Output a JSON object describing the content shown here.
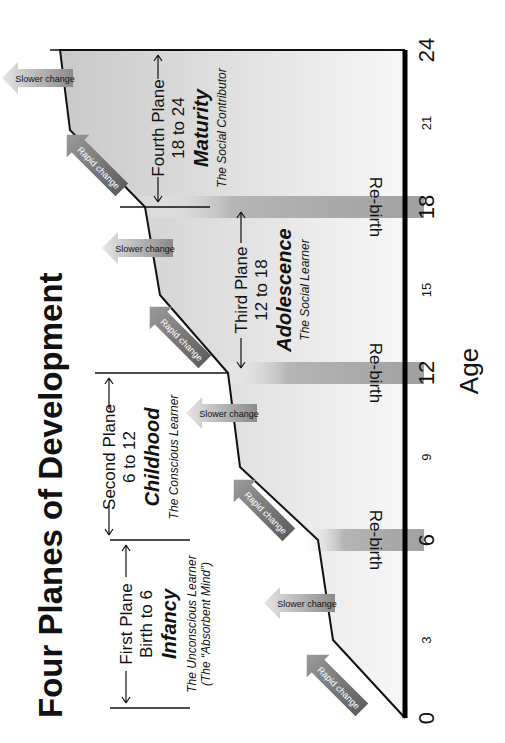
{
  "title": "Four Planes of Development",
  "axis": {
    "label": "Age",
    "ticks_major": [
      "0",
      "6",
      "12",
      "18",
      "24"
    ],
    "ticks_minor": [
      "3",
      "9",
      "15",
      "21"
    ]
  },
  "rebirth_label": "Re-birth",
  "planes": [
    {
      "name": "First Plane",
      "range": "Birth to 6",
      "stage": "Infancy",
      "description": "The Unconscious Learner",
      "description2": "(The “Absorbent Mind”)"
    },
    {
      "name": "Second Plane",
      "range": "6 to 12",
      "stage": "Childhood",
      "description": "The Conscious Learner"
    },
    {
      "name": "Third Plane",
      "range": "12 to 18",
      "stage": "Adolescence",
      "description": "The Social Learner"
    },
    {
      "name": "Fourth Plane",
      "range": "18 to 24",
      "stage": "Maturity",
      "description": "The Social Contributor"
    }
  ],
  "change_arrows": {
    "rapid": "Rapid change",
    "slower": "Slower change"
  },
  "colors": {
    "curve": "#111111",
    "band": "#a8a8a8",
    "fill_light": "#f2f2f2",
    "fill_dark": "#c4c4c4",
    "arrow": "#7a7a7a"
  }
}
